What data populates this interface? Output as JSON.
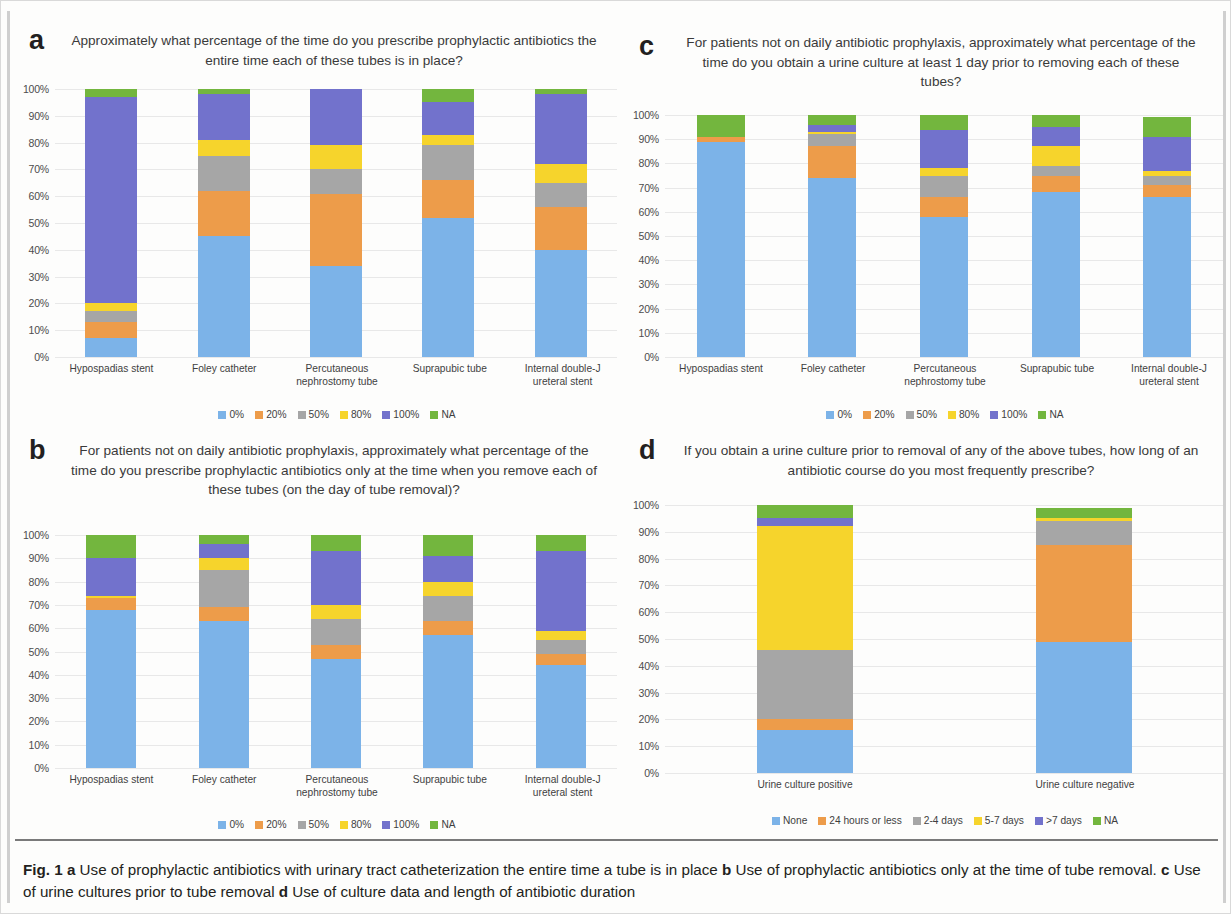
{
  "figure": {
    "caption_prefix": "Fig. 1",
    "caption_a_tag": "a",
    "caption_a_text": "Use of prophylactic antibiotics with urinary tract catheterization the entire time a tube is in place",
    "caption_b_tag": "b",
    "caption_b_text": "Use of prophylactic antibiotics only at the time of tube removal.",
    "caption_c_tag": "c",
    "caption_c_text": "Use of urine cultures prior to tube removal",
    "caption_d_tag": "d",
    "caption_d_text": "Use of culture data and length of antibiotic duration"
  },
  "colors": {
    "blue": "#7cb3e8",
    "orange": "#ed9c4a",
    "gray": "#a6a6a6",
    "yellow": "#f6d42c",
    "purple": "#7272cc",
    "green": "#73b63e",
    "gridline": "#e8e8e8",
    "text": "#3a3a3a"
  },
  "panels": {
    "a": {
      "letter": "a",
      "title": "Approximately what percentage of the time do you prescribe prophylactic antibiotics the entire time each of these tubes is in place?"
    },
    "b": {
      "letter": "b",
      "title": "For patients not on daily antibiotic prophylaxis, approximately what percentage of the time do you prescribe prophylactic antibiotics only at the time when you remove each of these tubes (on the day of tube removal)?"
    },
    "c": {
      "letter": "c",
      "title": "For patients not on daily antibiotic prophylaxis, approximately what percentage of the time do you obtain a urine culture at least 1 day prior to removing each of these tubes?"
    },
    "d": {
      "letter": "d",
      "title": "If you obtain a urine culture prior to removal of any of the above tubes, how long of an antibiotic course do you most frequently prescribe?"
    }
  },
  "chart_data": [
    {
      "id": "a",
      "type": "bar",
      "stacked": true,
      "title": "Approximately what percentage of the time do you prescribe prophylactic antibiotics the entire time each of these tubes is in place?",
      "xlabel": "",
      "ylabel": "",
      "ylim": [
        0,
        100
      ],
      "yticks": [
        "0%",
        "10%",
        "20%",
        "30%",
        "40%",
        "50%",
        "60%",
        "70%",
        "80%",
        "90%",
        "100%"
      ],
      "grid": true,
      "legend_position": "bottom",
      "categories": [
        "Hypospadias stent",
        "Foley catheter",
        "Percutaneous nephrostomy tube",
        "Suprapubic tube",
        "Internal double-J ureteral stent"
      ],
      "series": [
        {
          "name": "0%",
          "color": "#7cb3e8",
          "values": [
            7,
            45,
            34,
            52,
            40
          ]
        },
        {
          "name": "20%",
          "color": "#ed9c4a",
          "values": [
            6,
            17,
            27,
            14,
            16
          ]
        },
        {
          "name": "50%",
          "color": "#a6a6a6",
          "values": [
            4,
            13,
            9,
            13,
            9
          ]
        },
        {
          "name": "80%",
          "color": "#f6d42c",
          "values": [
            3,
            6,
            9,
            4,
            7
          ]
        },
        {
          "name": "100%",
          "color": "#7272cc",
          "values": [
            77,
            17,
            21,
            12,
            26
          ]
        },
        {
          "name": "NA",
          "color": "#73b63e",
          "values": [
            3,
            2,
            0,
            5,
            2
          ]
        }
      ]
    },
    {
      "id": "b",
      "type": "bar",
      "stacked": true,
      "title": "For patients not on daily antibiotic prophylaxis, approximately what percentage of the time do you prescribe prophylactic antibiotics only at the time when you remove each of these tubes (on the day of tube removal)?",
      "xlabel": "",
      "ylabel": "",
      "ylim": [
        0,
        100
      ],
      "yticks": [
        "0%",
        "10%",
        "20%",
        "30%",
        "40%",
        "50%",
        "60%",
        "70%",
        "80%",
        "90%",
        "100%"
      ],
      "grid": true,
      "legend_position": "bottom",
      "categories": [
        "Hypospadias stent",
        "Foley catheter",
        "Percutaneous nephrostomy tube",
        "Suprapubic tube",
        "Internal double-J ureteral stent"
      ],
      "series": [
        {
          "name": "0%",
          "color": "#7cb3e8",
          "values": [
            68,
            63,
            47,
            57,
            44
          ]
        },
        {
          "name": "20%",
          "color": "#ed9c4a",
          "values": [
            5,
            6,
            6,
            6,
            5
          ]
        },
        {
          "name": "50%",
          "color": "#a6a6a6",
          "values": [
            0,
            16,
            11,
            11,
            6
          ]
        },
        {
          "name": "80%",
          "color": "#f6d42c",
          "values": [
            1,
            5,
            6,
            6,
            4
          ]
        },
        {
          "name": "100%",
          "color": "#7272cc",
          "values": [
            16,
            6,
            23,
            11,
            34
          ]
        },
        {
          "name": "NA",
          "color": "#73b63e",
          "values": [
            10,
            4,
            7,
            9,
            7
          ]
        }
      ]
    },
    {
      "id": "c",
      "type": "bar",
      "stacked": true,
      "title": "For patients not on daily antibiotic prophylaxis, approximately what percentage of the time do you obtain a urine culture at least 1 day prior to removing each of these tubes?",
      "xlabel": "",
      "ylabel": "",
      "ylim": [
        0,
        100
      ],
      "yticks": [
        "0%",
        "10%",
        "20%",
        "30%",
        "40%",
        "50%",
        "60%",
        "70%",
        "80%",
        "90%",
        "100%"
      ],
      "grid": true,
      "legend_position": "bottom",
      "categories": [
        "Hypospadias stent",
        "Foley catheter",
        "Percutaneous nephrostomy tube",
        "Suprapubic tube",
        "Internal double-J ureteral stent"
      ],
      "series": [
        {
          "name": "0%",
          "color": "#7cb3e8",
          "values": [
            89,
            74,
            58,
            68,
            66
          ]
        },
        {
          "name": "20%",
          "color": "#ed9c4a",
          "values": [
            2,
            13,
            8,
            7,
            5
          ]
        },
        {
          "name": "50%",
          "color": "#a6a6a6",
          "values": [
            0,
            5,
            9,
            4,
            4
          ]
        },
        {
          "name": "80%",
          "color": "#f6d42c",
          "values": [
            0,
            1,
            3,
            8,
            2
          ]
        },
        {
          "name": "100%",
          "color": "#7272cc",
          "values": [
            0,
            3,
            16,
            8,
            14
          ]
        },
        {
          "name": "NA",
          "color": "#73b63e",
          "values": [
            9,
            4,
            6,
            5,
            8
          ]
        }
      ]
    },
    {
      "id": "d",
      "type": "bar",
      "stacked": true,
      "title": "If you obtain a urine culture prior to removal of any of the above tubes, how long of an antibiotic course do you most frequently prescribe?",
      "xlabel": "",
      "ylabel": "",
      "ylim": [
        0,
        100
      ],
      "yticks": [
        "0%",
        "10%",
        "20%",
        "30%",
        "40%",
        "50%",
        "60%",
        "70%",
        "80%",
        "90%",
        "100%"
      ],
      "grid": true,
      "legend_position": "bottom",
      "categories": [
        "Urine culture positive",
        "Urine culture negative"
      ],
      "series": [
        {
          "name": "None",
          "color": "#7cb3e8",
          "values": [
            16,
            49
          ]
        },
        {
          "name": "24 hours or less",
          "color": "#ed9c4a",
          "values": [
            4,
            36
          ]
        },
        {
          "name": "2-4 days",
          "color": "#a6a6a6",
          "values": [
            26,
            9
          ]
        },
        {
          "name": "5-7 days",
          "color": "#f6d42c",
          "values": [
            46,
            1
          ]
        },
        {
          "name": ">7 days",
          "color": "#7272cc",
          "values": [
            3,
            0
          ]
        },
        {
          "name": "NA",
          "color": "#73b63e",
          "values": [
            5,
            4
          ]
        }
      ]
    }
  ]
}
